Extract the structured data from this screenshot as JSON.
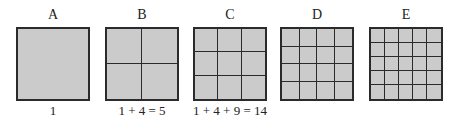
{
  "figure": {
    "panels": [
      {
        "label": "A",
        "grid_size": 1,
        "caption": "1"
      },
      {
        "label": "B",
        "grid_size": 2,
        "caption": "1 + 4 = 5"
      },
      {
        "label": "C",
        "grid_size": 3,
        "caption": "1 + 4 + 9 = 14"
      },
      {
        "label": "D",
        "grid_size": 4,
        "caption": ""
      },
      {
        "label": "E",
        "grid_size": 5,
        "caption": ""
      }
    ],
    "colors": {
      "fill": "#cbcbcb",
      "line": "#2b2b2b"
    }
  }
}
